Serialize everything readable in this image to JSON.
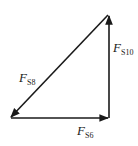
{
  "diagram": {
    "type": "force-triangle",
    "stroke_color": "#1a1a1a",
    "background": "#ffffff",
    "vertices": {
      "top_right": [
        108,
        15
      ],
      "bottom_left": [
        10,
        118
      ],
      "bottom_right": [
        109,
        118
      ]
    },
    "vectors": [
      {
        "id": "FS6",
        "label": "F",
        "subscript": "S6",
        "from": "bottom_left",
        "to": "bottom_right",
        "direction": "right"
      },
      {
        "id": "FS10",
        "label": "F",
        "subscript": "S10",
        "from": "bottom_right",
        "to": "top_right",
        "direction": "up"
      },
      {
        "id": "FS8",
        "label": "F",
        "subscript": "S8",
        "from": "top_right",
        "to": "bottom_left",
        "direction": "down-left"
      }
    ]
  },
  "labels": {
    "fs8_main": "F",
    "fs8_sub": "S8",
    "fs10_main": "F",
    "fs10_sub": "S10",
    "fs6_main": "F",
    "fs6_sub": "S6"
  }
}
